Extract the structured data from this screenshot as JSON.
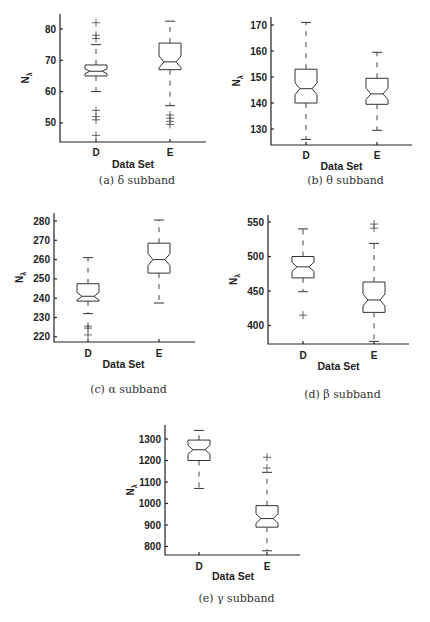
{
  "chart_data": [
    {
      "id": "a",
      "type": "boxplot",
      "caption": "(a) δ subband",
      "xlabel": "Data Set",
      "ylabel": "Nλ",
      "categories": [
        "D",
        "E"
      ],
      "yticks": [
        50,
        60,
        70,
        80
      ],
      "ylim": [
        44,
        85
      ],
      "notched": true,
      "series": [
        {
          "name": "D",
          "whisker_low": 60,
          "q1": 65,
          "median": 66.5,
          "q3": 68.5,
          "whisker_high": 75,
          "outliers": [
            46,
            51,
            52,
            54,
            77,
            78,
            82
          ]
        },
        {
          "name": "E",
          "whisker_low": 55.5,
          "q1": 67,
          "median": 69.5,
          "q3": 75.5,
          "whisker_high": 82.5,
          "outliers": [
            49.5,
            50.5,
            51.5,
            52.5
          ]
        }
      ],
      "layout": {
        "x0": 60,
        "x1": 206,
        "ytop": 14,
        "ybase": 142,
        "ref_val": 80,
        "ref_px": 29,
        "px_per_unit": 3.13,
        "xD": 96,
        "xE": 170,
        "half_w": 11,
        "caption_y": 184,
        "xlabel_y": 164,
        "xtick_y": 153
      }
    },
    {
      "id": "b",
      "type": "boxplot",
      "caption": "(b) θ subband",
      "xlabel": "Data Set",
      "ylabel": "Nλ",
      "categories": [
        "D",
        "E"
      ],
      "yticks": [
        130,
        140,
        150,
        160,
        170
      ],
      "ylim": [
        123,
        173
      ],
      "notched": true,
      "series": [
        {
          "name": "D",
          "whisker_low": 126,
          "q1": 140,
          "median": 145.5,
          "q3": 153,
          "whisker_high": 171,
          "outliers": []
        },
        {
          "name": "E",
          "whisker_low": 129.5,
          "q1": 139.5,
          "median": 143.5,
          "q3": 149.5,
          "whisker_high": 159.5,
          "outliers": []
        }
      ],
      "layout": {
        "x0": 271,
        "x1": 412,
        "ytop": 17,
        "ybase": 145,
        "ref_val": 170,
        "ref_px": 25,
        "px_per_unit": 2.6,
        "xD": 306,
        "xE": 377,
        "half_w": 11,
        "caption_y": 184,
        "xlabel_y": 166,
        "xtick_y": 156
      }
    },
    {
      "id": "c",
      "type": "boxplot",
      "caption": "(c) α subband",
      "xlabel": "Data Set",
      "ylabel": "Nλ",
      "categories": [
        "D",
        "E"
      ],
      "yticks": [
        220,
        230,
        240,
        250,
        260,
        270,
        280
      ],
      "ylim": [
        217,
        283
      ],
      "notched": true,
      "series": [
        {
          "name": "D",
          "whisker_low": 232,
          "q1": 238.5,
          "median": 241,
          "q3": 247.5,
          "whisker_high": 261,
          "outliers": [
            221,
            224.5,
            225.5
          ]
        },
        {
          "name": "E",
          "whisker_low": 237.5,
          "q1": 253,
          "median": 260,
          "q3": 268.5,
          "whisker_high": 280.5,
          "outliers": []
        }
      ],
      "layout": {
        "x0": 54,
        "x1": 195,
        "ytop": 213,
        "ybase": 342,
        "ref_val": 280,
        "ref_px": 221,
        "px_per_unit": 1.93,
        "xD": 88,
        "xE": 159,
        "half_w": 11,
        "caption_y": 393,
        "xlabel_y": 364,
        "xtick_y": 354
      }
    },
    {
      "id": "d",
      "type": "boxplot",
      "caption": "(d) β subband",
      "xlabel": "Data Set",
      "ylabel": "Nλ",
      "categories": [
        "D",
        "E"
      ],
      "yticks": [
        400,
        450,
        500,
        550
      ],
      "ylim": [
        372,
        560
      ],
      "notched": true,
      "series": [
        {
          "name": "D",
          "whisker_low": 449,
          "q1": 469,
          "median": 485,
          "q3": 500,
          "whisker_high": 540,
          "outliers": [
            415
          ]
        },
        {
          "name": "E",
          "whisker_low": 377,
          "q1": 419,
          "median": 437,
          "q3": 463,
          "whisker_high": 519,
          "outliers": [
            541,
            547
          ]
        }
      ],
      "layout": {
        "x0": 268,
        "x1": 409,
        "ytop": 215,
        "ybase": 344,
        "ref_val": 550,
        "ref_px": 222,
        "px_per_unit": 0.69,
        "xD": 303,
        "xE": 374,
        "half_w": 11,
        "caption_y": 398,
        "xlabel_y": 366,
        "xtick_y": 356
      }
    },
    {
      "id": "e",
      "type": "boxplot",
      "caption": "(e) γ subband",
      "xlabel": "Data Set",
      "ylabel": "Nλ",
      "categories": [
        "D",
        "E"
      ],
      "yticks": [
        800,
        900,
        1000,
        1100,
        1200,
        1300
      ],
      "ylim": [
        760,
        1360
      ],
      "notched": true,
      "series": [
        {
          "name": "D",
          "whisker_low": 1070,
          "q1": 1200,
          "median": 1250,
          "q3": 1295,
          "whisker_high": 1340,
          "outliers": []
        },
        {
          "name": "E",
          "whisker_low": 780,
          "q1": 890,
          "median": 930,
          "q3": 990,
          "whisker_high": 1145,
          "outliers": [
            1165,
            1215
          ]
        }
      ],
      "layout": {
        "x0": 165,
        "x1": 300,
        "ytop": 425,
        "ybase": 555,
        "ref_val": 1300,
        "ref_px": 439,
        "px_per_unit": 0.215,
        "xD": 199,
        "xE": 267,
        "half_w": 11,
        "caption_y": 602,
        "xlabel_y": 576,
        "xtick_y": 567
      }
    }
  ]
}
